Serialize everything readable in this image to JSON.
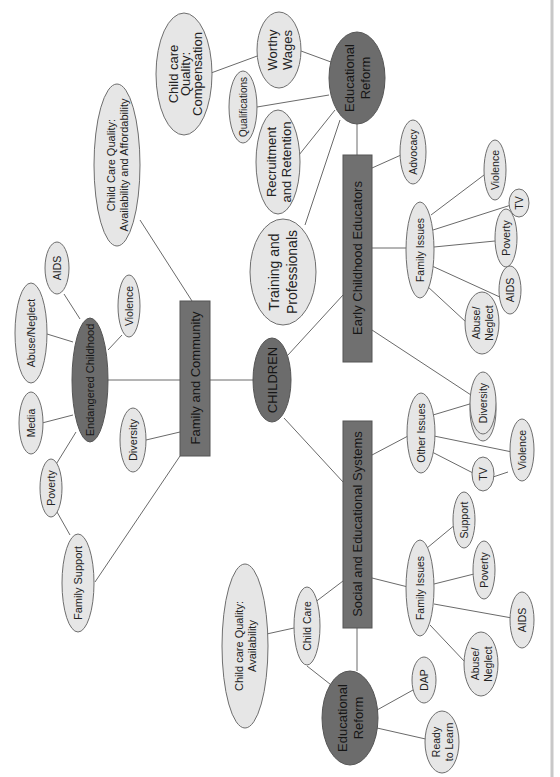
{
  "diagram": {
    "title": "CHILDREN",
    "orientation": "rotated 90 degrees counter-clockwise",
    "colors": {
      "dark_node": "#6c6c6c",
      "box_node": "#707070",
      "light_node": "#e6e6e6",
      "edge": "#6a6a6a",
      "page_border": "#c8c8c8"
    },
    "central": {
      "label": "CHILDREN"
    },
    "branches": {
      "family_community": {
        "label": "Family and Community",
        "children": {
          "childcare_avail_afford": {
            "line1": "Child Care Quality:",
            "line2": "Availability and Affordability"
          },
          "diversity": {
            "label": "Diversity"
          },
          "family_support": {
            "label": "Family Support"
          },
          "endangered": {
            "label": "Endangered Childhood",
            "children": {
              "aids": {
                "label": "AIDS"
              },
              "abuse": {
                "label": "Abuse/Neglect"
              },
              "media": {
                "label": "Media"
              },
              "poverty": {
                "label": "Poverty"
              },
              "violence": {
                "label": "Violence"
              }
            }
          }
        }
      },
      "early_childhood": {
        "label": "Early Childhood Educators",
        "children": {
          "advocacy": {
            "label": "Advocacy"
          },
          "training": {
            "line1": "Training and",
            "line2": "Professionals"
          },
          "diversity": {
            "label": "Diversity"
          },
          "family_issues": {
            "label": "Family Issues",
            "children": {
              "violence": {
                "label": "Violence"
              },
              "tv": {
                "label": "TV"
              },
              "poverty": {
                "label": "Poverty"
              },
              "aids": {
                "label": "AIDS"
              },
              "abuse": {
                "line1": "Abuse/",
                "line2": "Neglect"
              }
            }
          },
          "edu_reform": {
            "line1": "Educational",
            "line2": "Reform",
            "children": {
              "worthy_wages": {
                "line1": "Worthy",
                "line2": "Wages"
              },
              "qualifications": {
                "label": "Qualifications"
              },
              "recruitment": {
                "line1": "Recruitment",
                "line2": "and Retention"
              },
              "compensation": {
                "line1": "Child care",
                "line2": "Quality:",
                "line3": "Compensation"
              }
            }
          }
        }
      },
      "social_educational": {
        "label": "Social and Educational Systems",
        "children": {
          "child_care": {
            "label": "Child Care"
          },
          "childcare_avail": {
            "line1": "Child care Quality:",
            "line2": "Availability"
          },
          "other_issues": {
            "label": "Other Issues",
            "children": {
              "diversity": {
                "label": "Diversity"
              },
              "violence": {
                "label": "Violence"
              },
              "tv": {
                "label": "TV"
              }
            }
          },
          "family_issues": {
            "label": "Family Issues",
            "children": {
              "support": {
                "label": "Support"
              },
              "poverty": {
                "label": "Poverty"
              },
              "aids": {
                "label": "AIDS"
              },
              "abuse": {
                "line1": "Abuse/",
                "line2": "Neglect"
              }
            }
          },
          "edu_reform": {
            "line1": "Educational",
            "line2": "Reform",
            "children": {
              "dap": {
                "label": "DAP"
              },
              "ready": {
                "line1": "Ready",
                "line2": "to Learn"
              }
            }
          }
        }
      }
    }
  }
}
